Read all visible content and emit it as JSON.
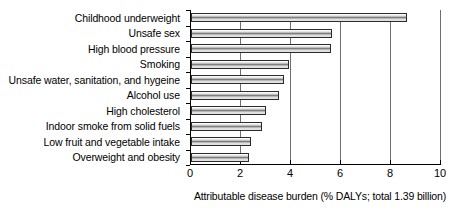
{
  "chart_data": {
    "type": "bar",
    "orientation": "horizontal",
    "title": "",
    "xlabel": "Attributable disease burden (% DALYs; total 1.39 billion)",
    "ylabel": "",
    "xlim": [
      0,
      10
    ],
    "xticks": [
      0,
      2,
      4,
      6,
      8,
      10
    ],
    "xtick_labels": [
      "0",
      "2",
      "4",
      "6",
      "8",
      "10"
    ],
    "grid": true,
    "grid_axis": "x",
    "legend": false,
    "categories": [
      "Childhood underweight",
      "Unsafe sex",
      "High blood pressure",
      "Smoking",
      "Unsafe water, sanitation, and hygeine",
      "Alcohol use",
      "High cholesterol",
      "Indoor smoke from solid fuels",
      "Low fruit and vegetable intake",
      "Overweight and obesity"
    ],
    "values": [
      8.65,
      5.65,
      5.6,
      3.9,
      3.7,
      3.5,
      3.0,
      2.85,
      2.4,
      2.3
    ],
    "bar_fill": "#cfcfcf",
    "bar_edge": "#2b2b2b",
    "grid_color": "#6f6f6f",
    "axis_color": "#000000",
    "background": "#ffffff"
  }
}
